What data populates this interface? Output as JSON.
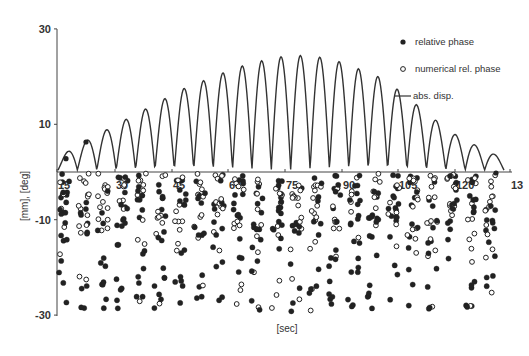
{
  "chart_data": {
    "type": "scatter+line",
    "title": "",
    "xlabel": "[sec]",
    "ylabel": "[mm], [deg]",
    "ylim": [
      -30,
      30
    ],
    "xlim": [
      15,
      136
    ],
    "grid": false,
    "legend_position": "top-right",
    "y_ticks": [
      "30",
      "10",
      "-10",
      "-30"
    ],
    "x_ticks": [
      "15",
      "30",
      "45",
      "60",
      "75",
      "90",
      "105",
      "120",
      "13"
    ],
    "legend": [
      {
        "marker": "filled-circle",
        "label": "relative phase"
      },
      {
        "marker": "open-circle",
        "label": "numerical rel. phase"
      },
      {
        "marker": "line",
        "label": "abs. disp."
      }
    ],
    "series": [
      {
        "name": "abs. disp.",
        "kind": "line",
        "description": "rectified oscillation (|sin|) with envelope rising to ~24 mm at ~t=75 s then decaying",
        "arch_count": 23,
        "peak_values": [
          2.5,
          5,
          7,
          9,
          11,
          13,
          15,
          17,
          18.5,
          20,
          21.5,
          22.5,
          23.5,
          24,
          24,
          23.5,
          22.5,
          21,
          19.5,
          17,
          14,
          11,
          8,
          6,
          4,
          2.5
        ]
      },
      {
        "name": "relative phase",
        "kind": "scatter",
        "marker": "filled",
        "description": "dense clusters between 0 and -30 deg in ~23 vertical bands aligned with each oscillation"
      },
      {
        "name": "numerical rel. phase",
        "kind": "scatter",
        "marker": "open",
        "description": "open circles concentrated between 0 and -15 deg within each band"
      }
    ]
  }
}
